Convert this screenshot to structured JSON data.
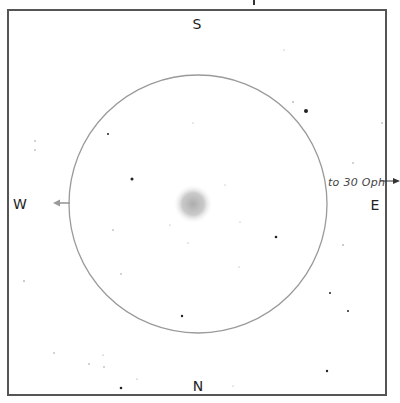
{
  "finder_chart": {
    "colors": {
      "frame": "#555555",
      "circle": "#9a9a9a",
      "west_arrow": "#999999",
      "east_arrow": "#333333",
      "nebula_core": "#a8a8a8",
      "star": "#222222",
      "faint_star": "#888888"
    },
    "cardinals": {
      "north": "N",
      "south": "S",
      "east": "E",
      "west": "W"
    },
    "pointer": {
      "label": "to 30 Oph",
      "direction": "east"
    },
    "field_circle": {
      "cx": 198,
      "cy": 204,
      "r": 129
    },
    "object": {
      "name": "fuzzy-object",
      "cx": 193,
      "cy": 204,
      "r": 20
    },
    "stars": [
      {
        "x": 306,
        "y": 111,
        "r": 2.0
      },
      {
        "x": 293,
        "y": 102,
        "r": 0.8
      },
      {
        "x": 132,
        "y": 179,
        "r": 1.5
      },
      {
        "x": 108,
        "y": 134,
        "r": 1.0
      },
      {
        "x": 35,
        "y": 141,
        "r": 0.7
      },
      {
        "x": 35,
        "y": 150,
        "r": 0.7
      },
      {
        "x": 276,
        "y": 237,
        "r": 1.3
      },
      {
        "x": 343,
        "y": 245,
        "r": 0.8
      },
      {
        "x": 330,
        "y": 293,
        "r": 1.0
      },
      {
        "x": 348,
        "y": 311,
        "r": 1.0
      },
      {
        "x": 182,
        "y": 316,
        "r": 1.2
      },
      {
        "x": 24,
        "y": 281,
        "r": 0.8
      },
      {
        "x": 113,
        "y": 230,
        "r": 0.7
      },
      {
        "x": 121,
        "y": 274,
        "r": 0.7
      },
      {
        "x": 353,
        "y": 163,
        "r": 0.7
      },
      {
        "x": 382,
        "y": 123,
        "r": 0.7
      },
      {
        "x": 327,
        "y": 371,
        "r": 1.2
      },
      {
        "x": 121,
        "y": 388,
        "r": 1.3
      },
      {
        "x": 54,
        "y": 353,
        "r": 0.7
      },
      {
        "x": 89,
        "y": 364,
        "r": 0.7
      },
      {
        "x": 104,
        "y": 367,
        "r": 0.7
      },
      {
        "x": 103,
        "y": 355,
        "r": 0.6
      },
      {
        "x": 137,
        "y": 379,
        "r": 0.6
      },
      {
        "x": 233,
        "y": 386,
        "r": 0.5
      },
      {
        "x": 284,
        "y": 50,
        "r": 0.5
      },
      {
        "x": 193,
        "y": 123,
        "r": 0.5
      },
      {
        "x": 240,
        "y": 222,
        "r": 0.5
      },
      {
        "x": 225,
        "y": 185,
        "r": 0.5
      },
      {
        "x": 188,
        "y": 243,
        "r": 0.5
      },
      {
        "x": 170,
        "y": 225,
        "r": 0.5
      },
      {
        "x": 239,
        "y": 267,
        "r": 0.5
      }
    ]
  }
}
